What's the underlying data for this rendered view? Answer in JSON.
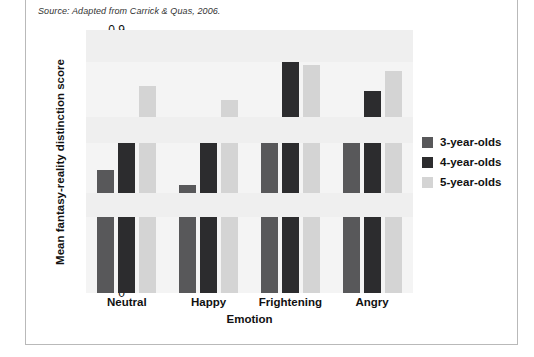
{
  "source_note": "Source: Adapted from Carrick & Quas, 2006.",
  "chart_data": {
    "type": "bar",
    "title": "",
    "xlabel": "Emotion",
    "ylabel": "Mean fantasy-reality distinction score",
    "categories": [
      "Neutral",
      "Happy",
      "Frightening",
      "Angry"
    ],
    "series": [
      {
        "name": "3-year-olds",
        "color": "#58585a",
        "values": [
          0.42,
          0.37,
          0.58,
          0.55
        ]
      },
      {
        "name": "4-year-olds",
        "color": "#2c2c2e",
        "values": [
          0.57,
          0.52,
          0.79,
          0.69
        ]
      },
      {
        "name": "5-year-olds",
        "color": "#d4d4d4",
        "values": [
          0.71,
          0.66,
          0.78,
          0.76
        ]
      }
    ],
    "ylim": [
      0,
      0.9
    ],
    "ytick_labels": [
      "0.9",
      "0.8",
      "0.7",
      "0.6",
      "0.5",
      "0.4",
      "0.3",
      "0.2",
      "0.1",
      "0"
    ],
    "ytick_values": [
      0.9,
      0.8,
      0.7,
      0.6,
      0.5,
      0.4,
      0.3,
      0.2,
      0.1,
      0
    ],
    "grid": false,
    "legend_position": "right",
    "plot_background": "#f4f4f4"
  }
}
